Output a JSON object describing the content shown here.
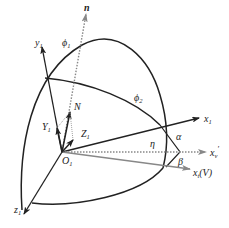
{
  "diagram": {
    "type": "3d-coordinate-frame",
    "origin": {
      "label": "O",
      "sub": "1"
    },
    "axes": [
      {
        "id": "n",
        "label": "n",
        "sub": "",
        "style": "dotted",
        "color": "#888888"
      },
      {
        "id": "y1",
        "label": "y",
        "sub": "1",
        "style": "solid",
        "color": "#222222"
      },
      {
        "id": "x1",
        "label": "x",
        "sub": "1",
        "style": "solid",
        "color": "#222222"
      },
      {
        "id": "xv",
        "label": "x",
        "sub": "v",
        "prime": "′",
        "style": "dotted",
        "color": "#888888"
      },
      {
        "id": "xt",
        "label": "x",
        "sub": "t",
        "suffix": "(V)",
        "style": "solid",
        "color": "#888888"
      },
      {
        "id": "z1",
        "label": "z",
        "sub": "1",
        "style": "solid",
        "color": "#222222"
      }
    ],
    "vectors": [
      {
        "id": "N",
        "label": "N",
        "sub": ""
      },
      {
        "id": "Y1",
        "label": "Y",
        "sub": "1"
      },
      {
        "id": "Z1",
        "label": "Z",
        "sub": "1"
      }
    ],
    "angles": [
      {
        "id": "phi1",
        "label": "ϕ",
        "sub": "1"
      },
      {
        "id": "phi2",
        "label": "ϕ",
        "sub": "2"
      },
      {
        "id": "eta",
        "label": "η"
      },
      {
        "id": "alpha",
        "label": "α"
      },
      {
        "id": "beta",
        "label": "β"
      }
    ]
  }
}
